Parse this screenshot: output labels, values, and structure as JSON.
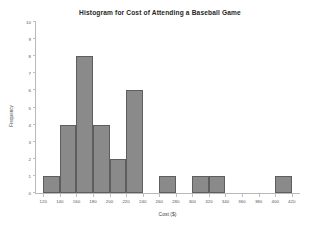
{
  "chart_data": {
    "type": "bar",
    "title": "Histogram for Cost of Attending a Baseball Game",
    "xlabel": "Cost ($)",
    "ylabel": "Frequency",
    "xlim": [
      110,
      430
    ],
    "ylim": [
      0,
      10
    ],
    "grid": false,
    "legend": "none",
    "bin_width": 20,
    "x_tick_labels": [
      "120",
      "140",
      "160",
      "180",
      "200",
      "220",
      "240",
      "260",
      "280",
      "300",
      "320",
      "340",
      "360",
      "380",
      "400",
      "420"
    ],
    "x_tick_values": [
      120,
      140,
      160,
      180,
      200,
      220,
      240,
      260,
      280,
      300,
      320,
      340,
      360,
      380,
      400,
      420
    ],
    "y_tick_labels": [
      "0",
      "1",
      "2",
      "3",
      "4",
      "5",
      "6",
      "7",
      "8",
      "9",
      "10"
    ],
    "y_tick_values": [
      0,
      1,
      2,
      3,
      4,
      5,
      6,
      7,
      8,
      9,
      10
    ],
    "bins": [
      {
        "start": 120,
        "end": 140,
        "frequency": 1
      },
      {
        "start": 140,
        "end": 160,
        "frequency": 4
      },
      {
        "start": 160,
        "end": 180,
        "frequency": 8
      },
      {
        "start": 180,
        "end": 200,
        "frequency": 4
      },
      {
        "start": 200,
        "end": 220,
        "frequency": 2
      },
      {
        "start": 220,
        "end": 240,
        "frequency": 6
      },
      {
        "start": 260,
        "end": 280,
        "frequency": 1
      },
      {
        "start": 300,
        "end": 320,
        "frequency": 1
      },
      {
        "start": 320,
        "end": 340,
        "frequency": 1
      },
      {
        "start": 400,
        "end": 420,
        "frequency": 1
      }
    ],
    "colors": {
      "bar_fill": "#8a8a8a",
      "bar_border": "#5e5e5e",
      "axis": "#b9b9b9",
      "title_text": "#262626",
      "tick_text": "#555555",
      "background": "#ffffff"
    }
  }
}
